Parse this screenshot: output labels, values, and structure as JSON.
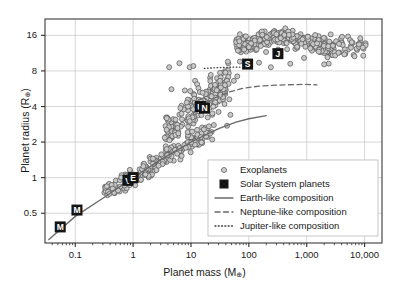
{
  "chart_data": {
    "type": "scatter",
    "title": "",
    "xlabel": "Planet mass (M⊕)",
    "ylabel": "Planet radius (R⊕)",
    "xlabel_base": "Planet mass (M",
    "xlabel_sub": "⊕",
    "xlabel_tail": ")",
    "ylabel_base": "Planet radius (R",
    "ylabel_sub": "⊕",
    "ylabel_tail": ")",
    "xscale": "log",
    "yscale": "log",
    "xlim": [
      0.03,
      20000
    ],
    "ylim": [
      0.28,
      22
    ],
    "grid": true,
    "xticks": [
      0.1,
      1,
      10,
      100,
      1000,
      10000
    ],
    "xtick_labels": [
      "0.1",
      "1",
      "10",
      "100",
      "1,000",
      "10,000"
    ],
    "yticks": [
      0.5,
      1,
      2,
      4,
      8,
      16
    ],
    "ytick_labels": [
      "0.5",
      "1",
      "2",
      "4",
      "8",
      "16"
    ],
    "legend_position": "lower-right",
    "legend": [
      {
        "label": "Exoplanets",
        "marker": "open-circle",
        "color": "#c9c9c9"
      },
      {
        "label": "Solar System planets",
        "marker": "filled-square",
        "color": "#1a1a1a"
      },
      {
        "label": "Earth-like composition",
        "marker": "solid-line",
        "color": "#6f6f6f"
      },
      {
        "label": "Neptune-like composition",
        "marker": "dashed-line",
        "color": "#6f6f6f"
      },
      {
        "label": "Jupiter-like composition",
        "marker": "dotted-line",
        "color": "#4a4a4a"
      }
    ],
    "series": [
      {
        "name": "Solar System planets",
        "marker": "filled-square",
        "points": [
          {
            "label": "M",
            "name": "Mercury",
            "x": 0.055,
            "y": 0.383
          },
          {
            "label": "M",
            "name": "Mars",
            "x": 0.107,
            "y": 0.532
          },
          {
            "label": "V",
            "name": "Venus",
            "x": 0.815,
            "y": 0.949
          },
          {
            "label": "E",
            "name": "Earth",
            "x": 1.0,
            "y": 1.0
          },
          {
            "label": "U",
            "name": "Uranus",
            "x": 14.5,
            "y": 4.0
          },
          {
            "label": "N",
            "name": "Neptune",
            "x": 17.1,
            "y": 3.87
          },
          {
            "label": "S",
            "name": "Saturn",
            "x": 95.2,
            "y": 9.14
          },
          {
            "label": "J",
            "name": "Jupiter",
            "x": 318.0,
            "y": 11.2
          }
        ]
      },
      {
        "name": "Earth-like composition",
        "type": "line",
        "style": "solid",
        "points": [
          [
            0.035,
            0.3
          ],
          [
            0.1,
            0.47
          ],
          [
            0.3,
            0.67
          ],
          [
            1.0,
            1.0
          ],
          [
            3.0,
            1.42
          ],
          [
            10.0,
            2.0
          ],
          [
            30.0,
            2.6
          ],
          [
            60.0,
            2.95
          ],
          [
            100.0,
            3.15
          ],
          [
            200.0,
            3.35
          ]
        ]
      },
      {
        "name": "Neptune-like composition",
        "type": "line",
        "style": "dashed",
        "points": [
          [
            11.0,
            3.5
          ],
          [
            15.0,
            4.0
          ],
          [
            25.0,
            4.7
          ],
          [
            45.0,
            5.3
          ],
          [
            80.0,
            5.7
          ],
          [
            150.0,
            5.95
          ],
          [
            400.0,
            6.1
          ],
          [
            900.0,
            6.15
          ],
          [
            1500.0,
            6.1
          ]
        ]
      },
      {
        "name": "Jupiter-like composition",
        "type": "line",
        "style": "dotted",
        "points": [
          [
            17.0,
            8.4
          ],
          [
            25.0,
            8.5
          ],
          [
            35.0,
            8.55
          ],
          [
            50.0,
            8.6
          ],
          [
            70.0,
            8.6
          ]
        ]
      },
      {
        "name": "Exoplanets",
        "type": "scatter",
        "marker": "open-circle",
        "count": 620,
        "clusters": [
          {
            "note": "small rocky / sub-Neptune ridge",
            "x_range": [
              0.3,
              20
            ],
            "y_range": [
              0.75,
              4.5
            ],
            "n": 190
          },
          {
            "note": "sub-Neptune to Neptune pile-up",
            "x_range": [
              3,
              40
            ],
            "y_range": [
              1.8,
              9.5
            ],
            "n": 150
          },
          {
            "note": "giant planet cloud",
            "x_range": [
              50,
              4000
            ],
            "y_range": [
              8,
              19
            ],
            "n": 250
          },
          {
            "note": "scattered hot giants",
            "x_range": [
              3000,
              12000
            ],
            "y_range": [
              10,
              17
            ],
            "n": 30
          }
        ]
      }
    ]
  }
}
